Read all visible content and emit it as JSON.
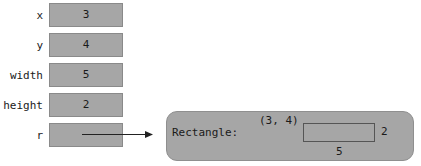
{
  "variables": [
    {
      "name": "x",
      "value": "3"
    },
    {
      "name": "y",
      "value": "4"
    },
    {
      "name": "width",
      "value": "5"
    },
    {
      "name": "height",
      "value": "2"
    },
    {
      "name": "r",
      "value": ""
    }
  ],
  "object": {
    "type_label": "Rectangle:",
    "corner_label": "(3, 4)",
    "width_label": "5",
    "height_label": "2"
  }
}
